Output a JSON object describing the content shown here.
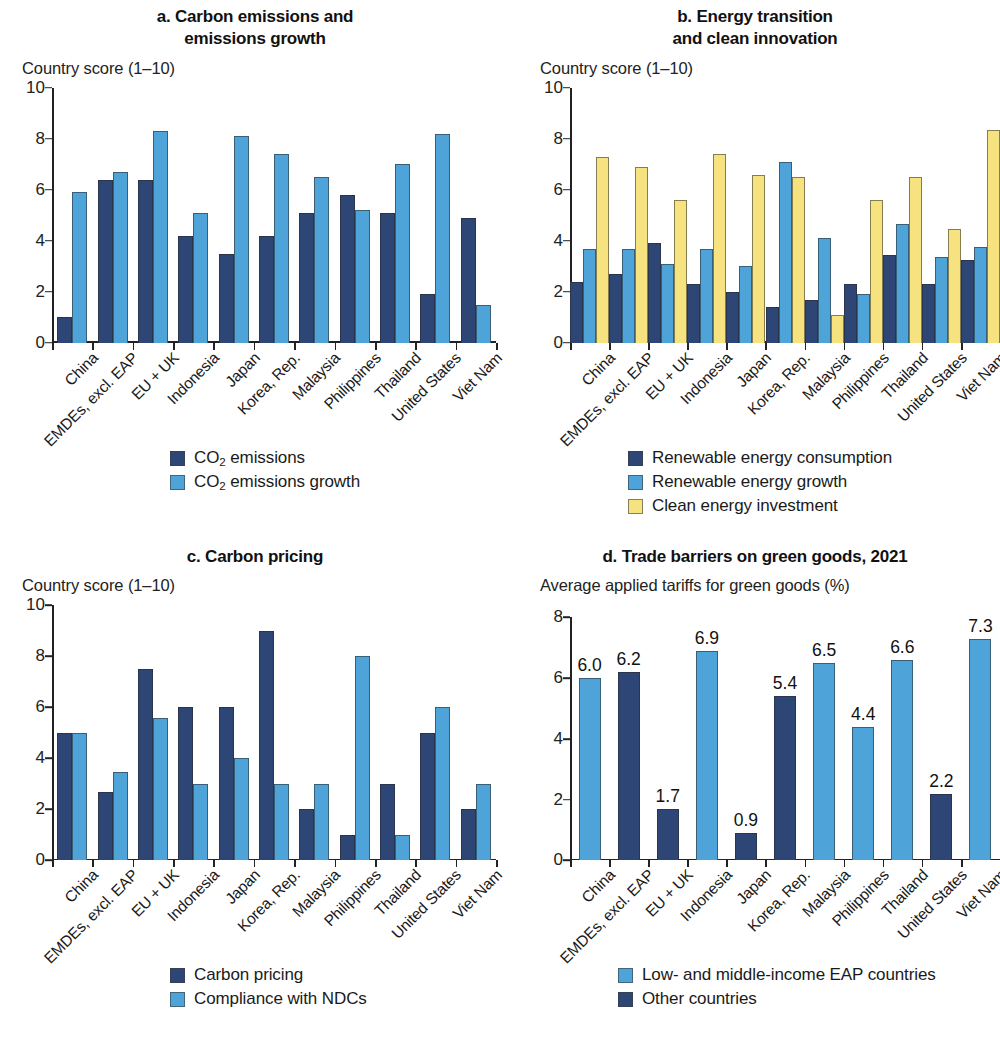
{
  "colors": {
    "dark_navy": "#2e4675",
    "light_blue": "#4ea3d8",
    "yellow": "#f6e27e"
  },
  "categories": [
    "China",
    "EMDEs, excl. EAP",
    "EU + UK",
    "Indonesia",
    "Japan",
    "Korea, Rep.",
    "Malaysia",
    "Philippines",
    "Thailand",
    "United States",
    "Viet Nam"
  ],
  "panel_a": {
    "title": "a. Carbon emissions and\nemissions growth",
    "title_line1": "a. Carbon emissions and",
    "title_line2": "emissions growth",
    "axis_label": "Country score (1–10)",
    "yticks": [
      "0",
      "2",
      "4",
      "6",
      "8",
      "10"
    ],
    "legend": [
      {
        "label_html": "CO<sub>2</sub> emissions",
        "color": "#2e4675"
      },
      {
        "label_html": "CO<sub>2</sub> emissions growth",
        "color": "#4ea3d8"
      }
    ],
    "chart_data": {
      "type": "bar",
      "title": "a. Carbon emissions and emissions growth",
      "ylabel": "Country score (1–10)",
      "xlabel": "",
      "ylim": [
        0,
        10
      ],
      "yticks": [
        0,
        2,
        4,
        6,
        8,
        10
      ],
      "grid": false,
      "legend_position": "bottom",
      "categories": [
        "China",
        "EMDEs, excl. EAP",
        "EU + UK",
        "Indonesia",
        "Japan",
        "Korea, Rep.",
        "Malaysia",
        "Philippines",
        "Thailand",
        "United States",
        "Viet Nam"
      ],
      "series": [
        {
          "name": "CO2 emissions",
          "color": "#2e4675",
          "values": [
            1.0,
            6.4,
            6.4,
            4.2,
            3.5,
            4.2,
            5.1,
            5.8,
            5.1,
            1.9,
            4.9
          ]
        },
        {
          "name": "CO2 emissions growth",
          "color": "#4ea3d8",
          "values": [
            5.9,
            6.7,
            8.3,
            5.1,
            8.1,
            7.4,
            6.5,
            5.2,
            7.0,
            8.2,
            1.5
          ]
        }
      ]
    }
  },
  "panel_b": {
    "title_line1": "b. Energy transition",
    "title_line2": "and clean innovation",
    "axis_label": "Country score (1–10)",
    "yticks": [
      "0",
      "2",
      "4",
      "6",
      "8",
      "10"
    ],
    "legend": [
      {
        "label_html": "Renewable energy consumption",
        "color": "#2e4675"
      },
      {
        "label_html": "Renewable energy growth",
        "color": "#4ea3d8"
      },
      {
        "label_html": "Clean energy investment",
        "color": "#f6e27e"
      }
    ],
    "chart_data": {
      "type": "bar",
      "title": "b. Energy transition and clean innovation",
      "ylabel": "Country score (1–10)",
      "xlabel": "",
      "ylim": [
        0,
        10
      ],
      "yticks": [
        0,
        2,
        4,
        6,
        8,
        10
      ],
      "grid": false,
      "legend_position": "bottom",
      "categories": [
        "China",
        "EMDEs, excl. EAP",
        "EU + UK",
        "Indonesia",
        "Japan",
        "Korea, Rep.",
        "Malaysia",
        "Philippines",
        "Thailand",
        "United States",
        "Viet Nam"
      ],
      "series": [
        {
          "name": "Renewable energy consumption",
          "color": "#2e4675",
          "values": [
            2.4,
            2.7,
            3.9,
            2.3,
            2.0,
            1.4,
            1.7,
            2.3,
            3.45,
            2.3,
            3.25
          ]
        },
        {
          "name": "Renewable energy growth",
          "color": "#4ea3d8",
          "values": [
            3.7,
            3.7,
            3.1,
            3.7,
            3.0,
            7.1,
            4.1,
            1.9,
            4.65,
            3.35,
            3.75
          ]
        },
        {
          "name": "Clean energy investment",
          "color": "#f6e27e",
          "values": [
            7.3,
            6.9,
            5.6,
            7.4,
            6.6,
            6.5,
            1.1,
            5.6,
            6.5,
            4.45,
            8.35
          ]
        }
      ]
    }
  },
  "panel_c": {
    "title_line1": "c. Carbon pricing",
    "title_line2": "",
    "axis_label": "Country score (1–10)",
    "yticks": [
      "0",
      "2",
      "4",
      "6",
      "8",
      "10"
    ],
    "legend": [
      {
        "label_html": "Carbon pricing",
        "color": "#2e4675"
      },
      {
        "label_html": "Compliance with NDCs",
        "color": "#4ea3d8"
      }
    ],
    "chart_data": {
      "type": "bar",
      "title": "c. Carbon pricing",
      "ylabel": "Country score (1–10)",
      "xlabel": "",
      "ylim": [
        0,
        10
      ],
      "yticks": [
        0,
        2,
        4,
        6,
        8,
        10
      ],
      "grid": false,
      "legend_position": "bottom",
      "categories": [
        "China",
        "EMDEs, excl. EAP",
        "EU + UK",
        "Indonesia",
        "Japan",
        "Korea, Rep.",
        "Malaysia",
        "Philippines",
        "Thailand",
        "United States",
        "Viet Nam"
      ],
      "series": [
        {
          "name": "Carbon pricing",
          "color": "#2e4675",
          "values": [
            5.0,
            2.7,
            7.5,
            6.0,
            6.0,
            9.0,
            2.0,
            1.0,
            3.0,
            5.0,
            2.0
          ]
        },
        {
          "name": "Compliance with NDCs",
          "color": "#4ea3d8",
          "values": [
            5.0,
            3.45,
            5.6,
            3.0,
            4.0,
            3.0,
            3.0,
            8.0,
            1.0,
            6.0,
            3.0
          ]
        }
      ]
    }
  },
  "panel_d": {
    "title_line1": "d. Trade barriers on green goods, 2021",
    "title_line2": "",
    "axis_label": "Average applied tariffs for green goods (%)",
    "yticks": [
      "0",
      "2",
      "4",
      "6",
      "8"
    ],
    "legend": [
      {
        "label_html": "Low- and middle-income EAP countries",
        "color": "#4ea3d8"
      },
      {
        "label_html": "Other countries",
        "color": "#2e4675"
      }
    ],
    "chart_data": {
      "type": "bar",
      "title": "d. Trade barriers on green goods, 2021",
      "ylabel": "Average applied tariffs for green goods (%)",
      "xlabel": "",
      "ylim": [
        0,
        8
      ],
      "yticks": [
        0,
        2,
        4,
        6,
        8
      ],
      "grid": false,
      "legend_position": "bottom",
      "categories": [
        "China",
        "EMDEs, excl. EAP",
        "EU + UK",
        "Indonesia",
        "Japan",
        "Korea, Rep.",
        "Malaysia",
        "Philippines",
        "Thailand",
        "United States",
        "Viet Nam"
      ],
      "values": [
        6.0,
        6.2,
        1.7,
        6.9,
        0.9,
        5.4,
        6.5,
        4.4,
        6.6,
        2.2,
        7.3
      ],
      "data_labels": [
        "6.0",
        "6.2",
        "1.7",
        "6.9",
        "0.9",
        "5.4",
        "6.5",
        "4.4",
        "6.6",
        "2.2",
        "7.3"
      ],
      "bar_groups": [
        "Low- and middle-income EAP countries",
        "Other countries",
        "Other countries",
        "Low- and middle-income EAP countries",
        "Other countries",
        "Other countries",
        "Low- and middle-income EAP countries",
        "Low- and middle-income EAP countries",
        "Low- and middle-income EAP countries",
        "Other countries",
        "Low- and middle-income EAP countries"
      ],
      "bar_colors": [
        "#4ea3d8",
        "#2e4675",
        "#2e4675",
        "#4ea3d8",
        "#2e4675",
        "#2e4675",
        "#4ea3d8",
        "#4ea3d8",
        "#4ea3d8",
        "#2e4675",
        "#4ea3d8"
      ]
    }
  }
}
